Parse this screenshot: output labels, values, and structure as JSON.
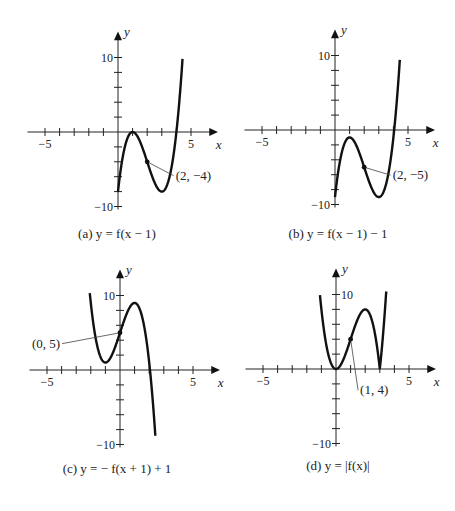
{
  "figure": {
    "base_function": "f(x) = 2x^2(x - 3)",
    "text_color": "#222222",
    "curve_color": "#111111"
  },
  "chart_data": [
    {
      "type": "line",
      "id": "a",
      "caption": "(a) y = f(x − 1)",
      "expression": "2(x-1)^2(x-4)",
      "xlabel": "x",
      "ylabel": "y",
      "xlim": [
        -6,
        7
      ],
      "ylim": [
        -10,
        12
      ],
      "x_ticks": [
        -5,
        -4,
        -3,
        -2,
        -1,
        1,
        2,
        3,
        4,
        5
      ],
      "x_tick_labels": [
        {
          "value": -5,
          "label": "−5"
        },
        {
          "value": 5,
          "label": "5"
        }
      ],
      "y_ticks": [
        -10,
        -8,
        -6,
        -4,
        -2,
        2,
        4,
        6,
        8,
        10
      ],
      "y_tick_labels": [
        {
          "value": 10,
          "label": "10"
        },
        {
          "value": -10,
          "label": "−10"
        }
      ],
      "domain": [
        0,
        4.42
      ],
      "annotations": [
        {
          "point": [
            2,
            -4
          ],
          "label": "(2, −4)",
          "label_pos": [
            3.95,
            -6.4
          ]
        }
      ],
      "key_points": [
        [
          1,
          0
        ],
        [
          3,
          -8
        ],
        [
          2,
          -4
        ]
      ],
      "grid": false,
      "origin_px": [
        118,
        132
      ]
    },
    {
      "type": "line",
      "id": "b",
      "caption": "(b) y = f(x − 1) − 1",
      "expression": "2(x-1)^2(x-4) - 1",
      "xlabel": "x",
      "ylabel": "y",
      "xlim": [
        -6,
        7
      ],
      "ylim": [
        -10,
        12
      ],
      "x_ticks": [
        -5,
        -4,
        -3,
        -2,
        -1,
        1,
        2,
        3,
        4,
        5
      ],
      "x_tick_labels": [
        {
          "value": -5,
          "label": "−5"
        },
        {
          "value": 5,
          "label": "5"
        }
      ],
      "y_ticks": [
        -10,
        -8,
        -6,
        -4,
        -2,
        2,
        4,
        6,
        8,
        10
      ],
      "y_tick_labels": [
        {
          "value": 10,
          "label": "10"
        },
        {
          "value": -10,
          "label": "−10"
        }
      ],
      "domain": [
        0,
        4.44
      ],
      "annotations": [
        {
          "point": [
            2,
            -5
          ],
          "label": "(2, −5)",
          "label_pos": [
            3.95,
            -6.6
          ]
        }
      ],
      "key_points": [
        [
          1,
          -1
        ],
        [
          3,
          -9
        ],
        [
          2,
          -5
        ]
      ],
      "grid": false,
      "origin_px": [
        335,
        130
      ]
    },
    {
      "type": "line",
      "id": "c",
      "caption": "(c) y = − f(x + 1) + 1",
      "expression": "-2(x+1)^2(x-2) + 1",
      "xlabel": "x",
      "ylabel": "y",
      "xlim": [
        -6,
        7
      ],
      "ylim": [
        -10,
        12
      ],
      "x_ticks": [
        -5,
        -4,
        -3,
        -2,
        -1,
        1,
        2,
        3,
        4,
        5
      ],
      "x_tick_labels": [
        {
          "value": -5,
          "label": "−5"
        },
        {
          "value": 5,
          "label": "5"
        }
      ],
      "y_ticks": [
        -10,
        -8,
        -6,
        -4,
        -2,
        2,
        4,
        6,
        8,
        10
      ],
      "y_tick_labels": [
        {
          "value": 10,
          "label": "10"
        },
        {
          "value": -10,
          "label": "−10"
        }
      ],
      "domain": [
        -2.07,
        2.42
      ],
      "annotations": [
        {
          "point": [
            0,
            5
          ],
          "label": "(0, 5)",
          "label_pos": [
            -4.1,
            3.0
          ]
        }
      ],
      "key_points": [
        [
          -1,
          1
        ],
        [
          1,
          9
        ],
        [
          0,
          5
        ]
      ],
      "grid": false,
      "origin_px": [
        120,
        370
      ]
    },
    {
      "type": "line",
      "id": "d",
      "caption": "(d) y = |f(x)|",
      "expression": "|2x^2(x-3)|",
      "xlabel": "x",
      "ylabel": "y",
      "xlim": [
        -6,
        7
      ],
      "ylim": [
        -10,
        12
      ],
      "x_ticks": [
        -5,
        -4,
        -3,
        -2,
        -1,
        1,
        2,
        3,
        4,
        5
      ],
      "x_tick_labels": [
        {
          "value": -5,
          "label": "−5"
        },
        {
          "value": 5,
          "label": "5"
        }
      ],
      "y_ticks": [
        -10,
        -8,
        -6,
        -4,
        -2,
        2,
        4,
        6,
        8,
        10
      ],
      "y_tick_labels": [
        {
          "value": 10,
          "label": "10"
        },
        {
          "value": -10,
          "label": "−10"
        }
      ],
      "domain": [
        -1.1,
        3.45
      ],
      "annotations": [
        {
          "point": [
            1,
            4
          ],
          "label": "(1, 4)",
          "label_pos": [
            1.65,
            -3.4
          ]
        }
      ],
      "key_points": [
        [
          0,
          0
        ],
        [
          2,
          8
        ],
        [
          3,
          0
        ],
        [
          1,
          4
        ]
      ],
      "grid": false,
      "origin_px": [
        336,
        369
      ]
    }
  ]
}
